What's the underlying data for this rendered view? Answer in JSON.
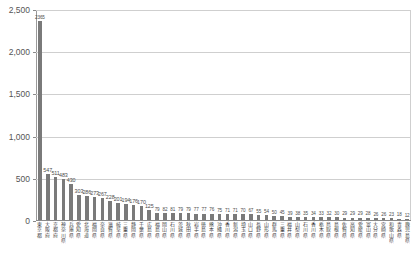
{
  "chart_data": {
    "type": "bar",
    "title": "",
    "subtitle": "",
    "xlabel": "",
    "ylabel": "",
    "ylim": [
      0,
      2500
    ],
    "ytick_labels": [
      "0",
      "500",
      "1,000",
      "1,500",
      "2,000",
      "2,500"
    ],
    "ytick_values": [
      0,
      500,
      1000,
      1500,
      2000,
      2500
    ],
    "grid": true,
    "legend": false,
    "legend_position": "none",
    "bar_color": "#7a7a7a",
    "axis_color": "#8a8a8a",
    "grid_color": "#cfcfcf",
    "label_color": "#4d4d4d",
    "categories": [
      "東京都",
      "大阪府",
      "京都府",
      "神奈川県",
      "兵庫県",
      "愛知県",
      "北海道",
      "福岡県",
      "奈良県",
      "滋賀県",
      "岐阜県",
      "三重県",
      "静岡県",
      "千葉県",
      "広島県",
      "福島県",
      "岡山県",
      "石川県",
      "茨城県",
      "秋田県",
      "岩手県",
      "徳島県",
      "熊本県",
      "沖縄県",
      "香川県",
      "新潟県",
      "埼玉県",
      "山口県",
      "長野県",
      "山形県",
      "群馬県",
      "三重県",
      "福井県",
      "山梨県",
      "石川県",
      "香川県",
      "栃木県",
      "鳥取県",
      "島根県",
      "佐賀県",
      "高知県",
      "愛媛県",
      "富山県",
      "大分県",
      "宮崎県",
      "和歌山県",
      "青森県",
      "鹿児島県"
    ],
    "values": [
      2365,
      547,
      511,
      483,
      430,
      303,
      286,
      273,
      267,
      228,
      201,
      194,
      176,
      170,
      125,
      79,
      82,
      81,
      79,
      79,
      77,
      77,
      76,
      75,
      71,
      71,
      70,
      67,
      55,
      54,
      50,
      45,
      39,
      38,
      35,
      34,
      33,
      32,
      30,
      29,
      29,
      29,
      28,
      26,
      26,
      23,
      18,
      12
    ],
    "value_labels": [
      "2365",
      "547",
      "511",
      "483",
      "430",
      "303",
      "286",
      "273",
      "267",
      "228",
      "201",
      "194",
      "176",
      "170",
      "125",
      "79",
      "82",
      "81",
      "79",
      "79",
      "77",
      "77",
      "76",
      "75",
      "71",
      "71",
      "70",
      "67",
      "55",
      "54",
      "50",
      "45",
      "39",
      "38",
      "35",
      "34",
      "33",
      "32",
      "30",
      "29",
      "29",
      "29",
      "28",
      "26",
      "26",
      "23",
      "18",
      "12"
    ]
  }
}
